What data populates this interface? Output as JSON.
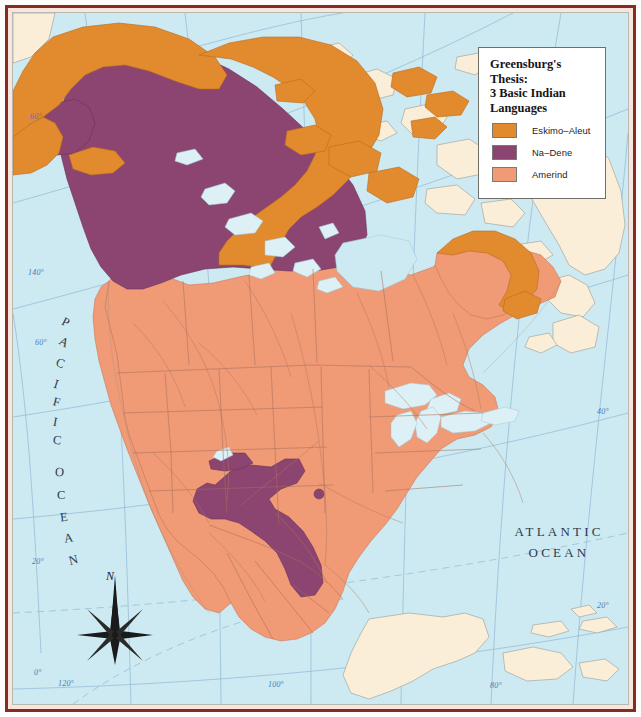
{
  "map": {
    "title": "Map of North America — Greenberg's Thesis language areas",
    "ocean_labels": {
      "atlantic_line1": "ATLANTIC",
      "atlantic_line2": "OCEAN",
      "pacific": "PACIFIC OCEAN"
    },
    "compass": {
      "north_label": "N"
    },
    "graticule_labels": [
      {
        "text": "60°",
        "x": 30,
        "y": 112
      },
      {
        "text": "140°",
        "x": 28,
        "y": 268
      },
      {
        "text": "60°",
        "x": 35,
        "y": 338
      },
      {
        "text": "20°",
        "x": 32,
        "y": 557
      },
      {
        "text": "0°",
        "x": 34,
        "y": 668
      },
      {
        "text": "120°",
        "x": 58,
        "y": 679
      },
      {
        "text": "100°",
        "x": 268,
        "y": 680
      },
      {
        "text": "80°",
        "x": 490,
        "y": 681
      },
      {
        "text": "60°",
        "x": 594,
        "y": 168
      },
      {
        "text": "40°",
        "x": 597,
        "y": 407
      },
      {
        "text": "20°",
        "x": 597,
        "y": 601
      }
    ]
  },
  "legend": {
    "title": "Greensburg's Thesis: 3 Basic Indian Languages",
    "title_lines": [
      "Greensburg's Thesis:",
      "3 Basic Indian",
      "Languages"
    ],
    "entries": [
      {
        "label": "Eskimo–Aleut",
        "color": "#E28A2E"
      },
      {
        "label": "Na–Dene",
        "color": "#8C4470"
      },
      {
        "label": "Amerind",
        "color": "#F09A76"
      }
    ]
  },
  "colors": {
    "ocean": "#cdeaf2",
    "land_outside": "#faeed8",
    "eskimo_aleut": "#E28A2E",
    "na_dene": "#8C4470",
    "amerind": "#F09A76",
    "lake": "#dcf0f6",
    "coastline": "#9a9a93",
    "border_line": "#a8705a",
    "graticule": "#8fb4d6",
    "frame": "#8a2b22"
  }
}
